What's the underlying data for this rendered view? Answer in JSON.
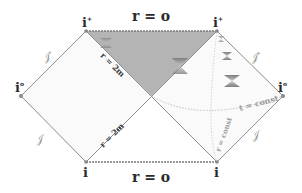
{
  "diagram": {
    "type": "penrose_diagram",
    "colors": {
      "background": "#ffffff",
      "boundary_line": "#8c8c8c",
      "black_hole_region": "#b4b4b4",
      "dashed_singularity": "#7a7a7a",
      "light_cone": "#8f8f8f",
      "const_curves": "#bdbdbd",
      "vertex_dot": "#8a8a8a"
    },
    "labels": {
      "singularity_top": "r = o",
      "singularity_bottom": "r = o",
      "horizon_upper": "r = 2m",
      "horizon_lower": "r = 2m",
      "t_const": "t = const",
      "r_const": "r = const",
      "i_plus_left": "i",
      "i_plus_left_sup": "+",
      "i_plus_right": "i",
      "i_plus_right_sup": "+",
      "i_zero_left": "i",
      "i_zero_left_sup": "o",
      "i_zero_right": "i",
      "i_zero_right_sup": "o",
      "i_minus_left": "i",
      "i_minus_left_sup": "-",
      "i_minus_right": "i",
      "i_minus_right_sup": "-",
      "scri_plus_left": "𝒥",
      "scri_plus_left_sup": "+",
      "scri_plus_right": "𝒥",
      "scri_plus_right_sup": "+",
      "scri_minus_left": "𝒥",
      "scri_minus_left_sup": "-",
      "scri_minus_right": "𝒥",
      "scri_minus_right_sup": "-"
    },
    "vertices": {
      "i_plus_left": [
        86,
        31
      ],
      "i_plus_right": [
        217,
        31
      ],
      "i_zero_left": [
        21,
        96
      ],
      "i_zero_right": [
        283,
        96
      ],
      "i_minus_left": [
        86,
        162
      ],
      "i_minus_right": [
        217,
        162
      ],
      "center": [
        151.5,
        96
      ]
    }
  }
}
